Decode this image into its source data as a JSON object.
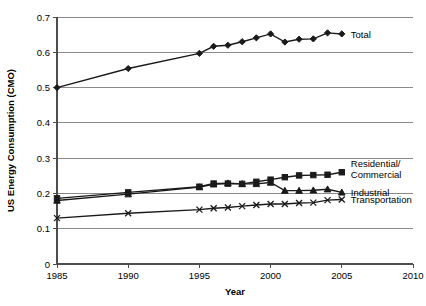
{
  "chart_data": {
    "type": "line",
    "title": "",
    "xlabel": "Year",
    "ylabel": "US Energy Consumption (CMO)",
    "xlim": [
      1985,
      2010
    ],
    "ylim": [
      0,
      0.7
    ],
    "grid": true,
    "legend_position": "right-inline-labels",
    "x_ticks": [
      "1985",
      "1990",
      "1995",
      "2000",
      "2005",
      "2010"
    ],
    "x_tick_values": [
      1985,
      1990,
      1995,
      2000,
      2005,
      2010
    ],
    "y_ticks": [
      "0",
      "0.1",
      "0.2",
      "0.3",
      "0.4",
      "0.5",
      "0.6",
      "0.7"
    ],
    "y_tick_values": [
      0,
      0.1,
      0.2,
      0.3,
      0.4,
      0.5,
      0.6,
      0.7
    ],
    "x": [
      1985,
      1990,
      1995,
      1996,
      1997,
      1998,
      1999,
      2000,
      2001,
      2002,
      2003,
      2004,
      2005
    ],
    "series": [
      {
        "name": "Total",
        "label": "Total",
        "marker": "diamond",
        "values": [
          0.5,
          0.554,
          0.597,
          0.617,
          0.62,
          0.63,
          0.641,
          0.652,
          0.629,
          0.637,
          0.638,
          0.655,
          0.652
        ]
      },
      {
        "name": "Residential/Commercial",
        "label": "Residential/\nCommercial",
        "label_line1": "Residential/",
        "label_line2": "Commercial",
        "marker": "square",
        "values": [
          0.186,
          0.203,
          0.219,
          0.228,
          0.228,
          0.227,
          0.233,
          0.239,
          0.246,
          0.251,
          0.252,
          0.253,
          0.26
        ]
      },
      {
        "name": "Industrial",
        "label": "Industrial",
        "marker": "triangle",
        "values": [
          0.18,
          0.198,
          0.218,
          0.226,
          0.229,
          0.227,
          0.227,
          0.231,
          0.208,
          0.208,
          0.209,
          0.212,
          0.203
        ]
      },
      {
        "name": "Transportation",
        "label": "Transportation",
        "marker": "cross",
        "values": [
          0.13,
          0.144,
          0.154,
          0.158,
          0.16,
          0.164,
          0.167,
          0.17,
          0.17,
          0.173,
          0.174,
          0.181,
          0.183
        ]
      }
    ]
  }
}
